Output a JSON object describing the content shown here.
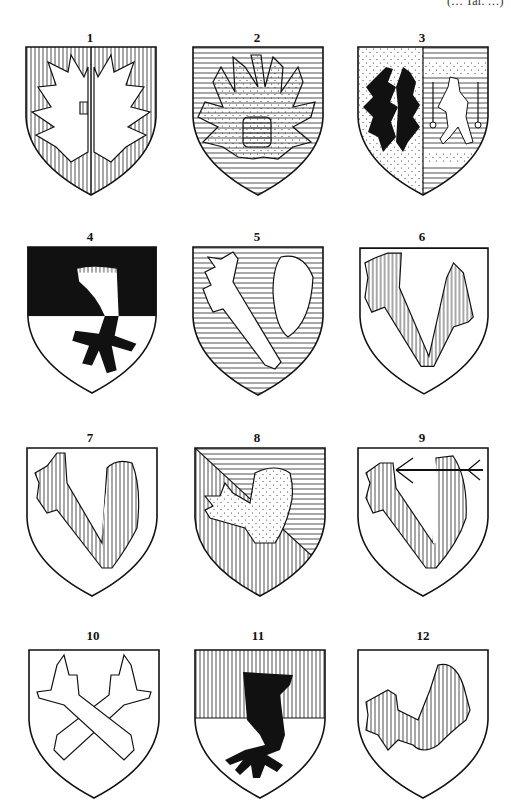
{
  "page": {
    "reference_note": "(… Taf. …)",
    "background": "#ffffff",
    "ink": "#111111"
  },
  "shields": [
    {
      "number": "1",
      "description": "Paly field, two wings displayed addorsed (split eagle) argent"
    },
    {
      "number": "2",
      "description": "Barry field, eagle displayed powdered (dotted) with barry body"
    },
    {
      "number": "3",
      "description": "Per pale: dotted field with two black wings; barry/dotted field with crowned lion between two keys"
    },
    {
      "number": "4",
      "description": "Per fess sable and argent, eagle's leg erased with talons counterchanged"
    },
    {
      "number": "5",
      "description": "Barry field, eagle's leg and wing argent"
    },
    {
      "number": "6",
      "description": "Argent field, eagle's leg and wing paly"
    },
    {
      "number": "7",
      "description": "Argent field, eagle's leg with paly wing"
    },
    {
      "number": "8",
      "description": "Per bend paly and barry, eagle's leg and wing powdered"
    },
    {
      "number": "9",
      "description": "Argent field, eagle's leg and wing paly pierced by an arrow"
    },
    {
      "number": "10",
      "description": "Argent field, two eagle's legs in saltire"
    },
    {
      "number": "11",
      "description": "Per fess paly and argent, eagle's leg sable"
    },
    {
      "number": "12",
      "description": "Argent field, eagle's leg and wing paly with feathered edge"
    }
  ]
}
